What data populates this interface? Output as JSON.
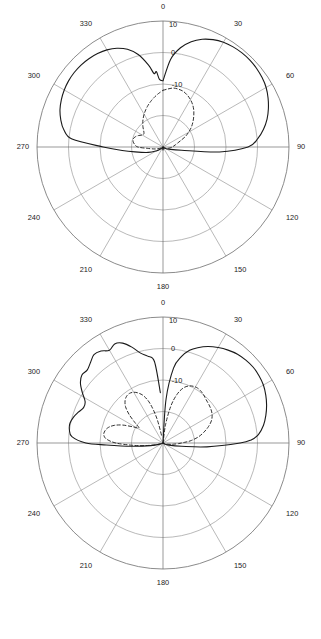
{
  "figure": {
    "type": "polar-radiation-pattern-figure",
    "subplots": [
      {
        "id": "a",
        "caption": "(a)"
      },
      {
        "id": "b",
        "caption": "(b)"
      }
    ]
  },
  "polar": {
    "angle_labels": [
      "0",
      "30",
      "60",
      "90",
      "120",
      "150",
      "180",
      "210",
      "240",
      "270",
      "300",
      "330"
    ],
    "angle_values_deg": [
      0,
      30,
      60,
      90,
      120,
      150,
      180,
      210,
      240,
      270,
      300,
      330
    ],
    "radial_labels": [
      "10",
      "0",
      "-10"
    ],
    "radial_values_db": [
      10,
      0,
      -10
    ],
    "ring_count": 4,
    "grid_color": "#8a8a8a",
    "curve_color": "#1a1a1a"
  },
  "chart_data": [
    {
      "type": "line",
      "id": "a",
      "title": "(a)",
      "polar": true,
      "xlabel": "Angle (degrees)",
      "ylabel": "Gain (dB)",
      "ylim": [
        -30,
        10
      ],
      "grid": true,
      "legend": "none",
      "angle_tick_labels": [
        "0",
        "30",
        "60",
        "90",
        "120",
        "150",
        "180",
        "210",
        "240",
        "270",
        "300",
        "330"
      ],
      "radial_tick_labels": [
        "10",
        "0",
        "-10"
      ],
      "series": [
        {
          "name": "co-polarization",
          "style": "solid",
          "theta_deg": [
            0,
            5,
            10,
            15,
            20,
            25,
            30,
            35,
            40,
            45,
            50,
            55,
            60,
            65,
            70,
            75,
            80,
            85,
            90,
            95,
            100,
            110,
            120,
            130,
            140,
            150,
            160,
            170,
            180,
            190,
            200,
            210,
            220,
            230,
            240,
            250,
            260,
            265,
            270,
            275,
            280,
            285,
            290,
            295,
            300,
            305,
            310,
            315,
            320,
            325,
            330,
            335,
            340,
            345,
            350,
            353,
            355,
            357,
            360
          ],
          "values_db": [
            -9.0,
            -2.0,
            2.0,
            4.6,
            6.4,
            7.6,
            8.4,
            8.8,
            9.0,
            9.0,
            8.8,
            8.4,
            7.8,
            6.8,
            5.6,
            4.2,
            2.4,
            0.2,
            -3.0,
            -12.0,
            -24.0,
            -28.0,
            -29.0,
            -29.5,
            -30.0,
            -30.0,
            -30.0,
            -29.5,
            -29.0,
            -29.5,
            -30.0,
            -30.0,
            -30.0,
            -29.0,
            -27.5,
            -25.0,
            -21.0,
            -17.0,
            -11.0,
            -1.0,
            2.0,
            3.6,
            4.8,
            5.6,
            6.2,
            6.6,
            6.8,
            6.8,
            6.6,
            6.2,
            5.6,
            4.6,
            3.0,
            0.4,
            -3.6,
            -6.5,
            -6.0,
            -8.5,
            -9.0
          ]
        },
        {
          "name": "cross-polarization",
          "style": "dashed",
          "theta_deg": [
            0,
            5,
            10,
            15,
            20,
            25,
            30,
            35,
            40,
            45,
            50,
            55,
            60,
            65,
            70,
            75,
            80,
            85,
            90,
            100,
            110,
            120,
            140,
            160,
            180,
            200,
            220,
            240,
            255,
            265,
            270,
            275,
            280,
            285,
            290,
            295,
            300,
            305,
            310,
            315,
            320,
            325,
            330,
            335,
            340,
            345,
            350,
            355,
            360
          ],
          "values_db": [
            -12.0,
            -11.5,
            -11.0,
            -11.0,
            -11.2,
            -11.8,
            -12.6,
            -13.6,
            -14.8,
            -16.2,
            -17.6,
            -19.0,
            -20.6,
            -22.2,
            -24.0,
            -25.2,
            -26.0,
            -26.6,
            -27.0,
            -28.0,
            -28.8,
            -29.4,
            -30.0,
            -30.0,
            -30.0,
            -30.0,
            -30.0,
            -29.4,
            -27.6,
            -25.0,
            -22.0,
            -21.0,
            -20.4,
            -20.2,
            -20.6,
            -21.4,
            -22.4,
            -22.6,
            -22.0,
            -21.0,
            -20.0,
            -19.0,
            -18.0,
            -17.0,
            -16.0,
            -15.0,
            -14.0,
            -13.0,
            -12.0
          ]
        }
      ]
    },
    {
      "type": "line",
      "id": "b",
      "title": "(b)",
      "polar": true,
      "xlabel": "Angle (degrees)",
      "ylabel": "Gain (dB)",
      "ylim": [
        -30,
        10
      ],
      "grid": true,
      "legend": "none",
      "angle_tick_labels": [
        "0",
        "30",
        "60",
        "90",
        "120",
        "150",
        "180",
        "210",
        "240",
        "270",
        "300",
        "330"
      ],
      "radial_tick_labels": [
        "10",
        "0",
        "-10"
      ],
      "series": [
        {
          "name": "co-polarization",
          "style": "solid",
          "theta_deg": [
            2,
            4,
            8,
            12,
            16,
            20,
            25,
            30,
            35,
            40,
            45,
            50,
            55,
            60,
            65,
            70,
            75,
            80,
            85,
            88,
            90,
            95,
            100,
            110,
            120,
            130,
            140,
            150,
            160,
            170,
            180,
            190,
            200,
            210,
            220,
            230,
            240,
            250,
            258,
            264,
            268,
            270,
            274,
            278,
            282,
            286,
            290,
            294,
            298,
            302,
            306,
            310,
            314,
            318,
            322,
            326,
            330,
            334,
            338,
            342,
            346,
            350,
            354,
            357
          ],
          "values_db": [
            -30.0,
            -16.0,
            -6.0,
            -2.0,
            0.6,
            2.2,
            3.8,
            5.0,
            6.0,
            6.8,
            7.2,
            7.4,
            7.2,
            6.8,
            6.0,
            5.0,
            3.8,
            2.4,
            0.4,
            -2.0,
            -5.5,
            -16.0,
            -24.0,
            -28.0,
            -29.4,
            -30.0,
            -30.0,
            -30.0,
            -30.0,
            -30.0,
            -30.0,
            -30.0,
            -30.0,
            -30.0,
            -30.0,
            -30.0,
            -30.0,
            -29.0,
            -26.0,
            -20.0,
            -12.0,
            -5.5,
            -1.0,
            0.0,
            0.2,
            -0.4,
            -1.4,
            -2.4,
            -2.0,
            0.2,
            2.4,
            3.6,
            3.4,
            4.4,
            5.6,
            5.2,
            4.0,
            5.0,
            4.2,
            2.0,
            -0.6,
            -2.0,
            -4.0,
            -14.0
          ]
        },
        {
          "name": "cross-polarization",
          "style": "dashed",
          "theta_deg": [
            4,
            8,
            12,
            16,
            20,
            24,
            28,
            32,
            36,
            40,
            45,
            50,
            55,
            60,
            65,
            70,
            75,
            80,
            85,
            88,
            92,
            96,
            100,
            110,
            120,
            140,
            160,
            180,
            200,
            220,
            240,
            255,
            262,
            266,
            270,
            274,
            278,
            282,
            286,
            290,
            294,
            298,
            302,
            306,
            310,
            314,
            318,
            322,
            326,
            330,
            334,
            338,
            342,
            346,
            350
          ],
          "values_db": [
            -30.0,
            -24.0,
            -18.0,
            -14.0,
            -11.5,
            -10.2,
            -9.6,
            -9.4,
            -9.6,
            -10.0,
            -10.6,
            -11.0,
            -11.4,
            -12.0,
            -13.0,
            -14.6,
            -16.5,
            -18.5,
            -21.0,
            -23.0,
            -25.0,
            -26.5,
            -27.5,
            -29.0,
            -29.6,
            -30.0,
            -30.0,
            -30.0,
            -30.0,
            -30.0,
            -30.0,
            -28.0,
            -24.0,
            -20.0,
            -15.0,
            -12.0,
            -11.0,
            -11.2,
            -12.0,
            -13.6,
            -16.0,
            -19.0,
            -21.0,
            -19.0,
            -16.0,
            -13.5,
            -12.0,
            -11.2,
            -11.0,
            -11.4,
            -12.4,
            -14.0,
            -17.0,
            -22.0,
            -28.0
          ]
        }
      ]
    }
  ]
}
